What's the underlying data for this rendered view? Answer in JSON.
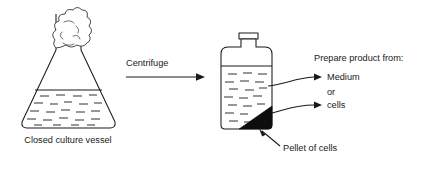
{
  "figure": {
    "background_color": "#ffffff",
    "ink_color": "#1a1a1a",
    "pellet_color": "#0d0d0d"
  },
  "left_vessel": {
    "caption": "Closed culture vessel",
    "contents_note": "foam",
    "type": "conical-flask"
  },
  "process": {
    "step_label": "Centrifuge",
    "arrow": "right-arrow"
  },
  "right_vessel": {
    "type": "centrifuge-bottle",
    "pellet_label": "Pellet of cells"
  },
  "product_options": {
    "heading": "Prepare product from:",
    "option_one": "Medium",
    "conjunction": "or",
    "option_two": "cells"
  }
}
